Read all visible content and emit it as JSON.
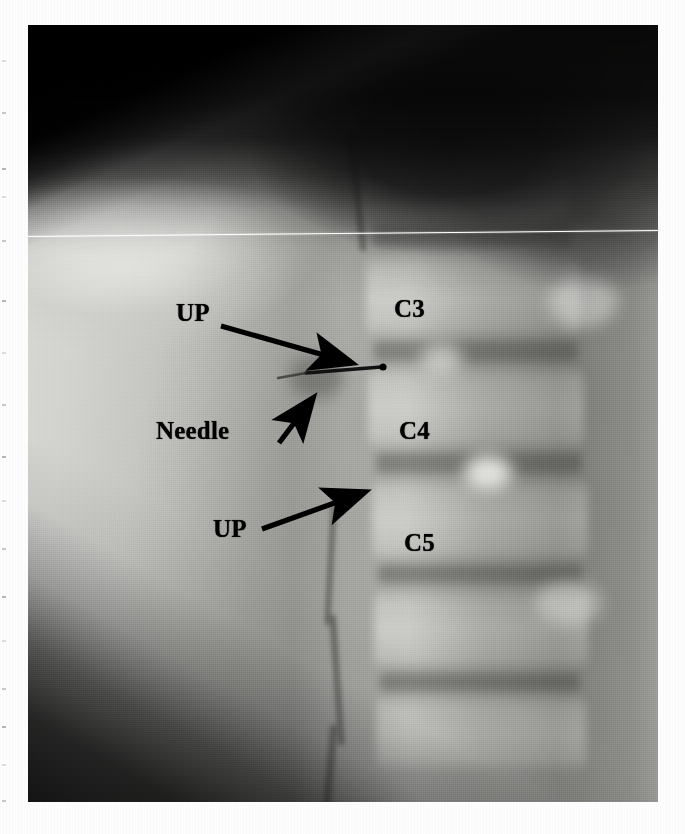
{
  "figure": {
    "modality": "x-ray",
    "view": "lateral cervical spine fluoroscopic image",
    "plate": {
      "x": 28,
      "y": 25,
      "width": 630,
      "height": 777
    }
  },
  "annotations": {
    "labels": [
      {
        "id": "up-upper",
        "text": "UP",
        "x": 176,
        "y": 300,
        "kind": "pointer"
      },
      {
        "id": "needle",
        "text": "Needle",
        "x": 156,
        "y": 418,
        "kind": "pointer"
      },
      {
        "id": "up-lower",
        "text": "UP",
        "x": 213,
        "y": 516,
        "kind": "pointer"
      },
      {
        "id": "level-c3",
        "text": "C3",
        "x": 394,
        "y": 296,
        "kind": "level"
      },
      {
        "id": "level-c4",
        "text": "C4",
        "x": 399,
        "y": 418,
        "kind": "level"
      },
      {
        "id": "level-c5",
        "text": "C5",
        "x": 404,
        "y": 530,
        "kind": "level"
      }
    ],
    "arrows": [
      {
        "id": "arrow-up-upper",
        "from": [
          221,
          326
        ],
        "to": [
          352,
          363
        ],
        "points_to": "uncinate process C3-C4"
      },
      {
        "id": "arrow-needle",
        "from": [
          279,
          443
        ],
        "to": [
          313,
          398
        ],
        "points_to": "needle tip"
      },
      {
        "id": "arrow-up-lower",
        "from": [
          262,
          529
        ],
        "to": [
          365,
          492
        ],
        "points_to": "uncinate process C5"
      }
    ],
    "needle": {
      "id": "needle-shaft",
      "from": [
        306,
        373
      ],
      "to": [
        381,
        367
      ],
      "hub": [
        383,
        367
      ],
      "description": "thin radiopaque needle with hub"
    }
  },
  "colors": {
    "annotation_black": "#000000",
    "scanline_white": "#ffffff",
    "plate_mid_gray": "#8a8a8a",
    "plate_light_gray": "#d9d9d6",
    "plate_dark": "#050505",
    "page_white": "#fdfdfd"
  },
  "artifacts": {
    "scanline": {
      "y_left": 236,
      "y_right": 230,
      "color": "#ffffff"
    },
    "edge_ticks": [
      60,
      112,
      168,
      196,
      240,
      300,
      352,
      404,
      456,
      500,
      548,
      596,
      640,
      688,
      726,
      764,
      800
    ]
  }
}
